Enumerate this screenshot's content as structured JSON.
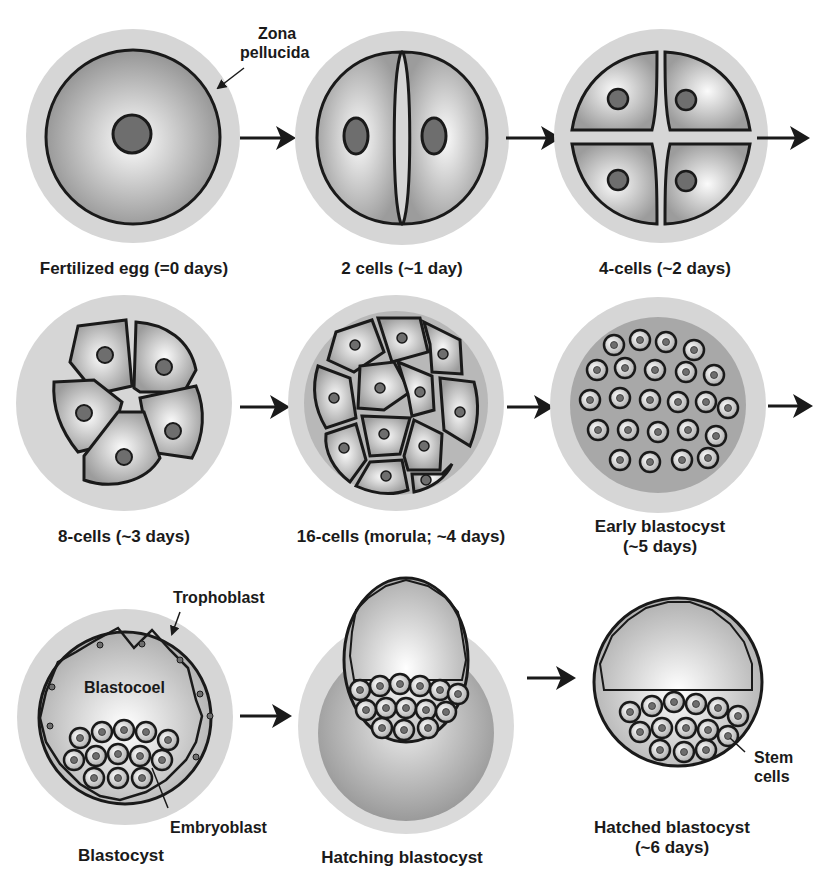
{
  "diagram": {
    "stages": [
      {
        "id": "fertilized-egg",
        "label": "Fertilized egg (=0 days)"
      },
      {
        "id": "2-cells",
        "label": "2 cells (~1 day)"
      },
      {
        "id": "4-cells",
        "label": "4-cells (~2 days)"
      },
      {
        "id": "8-cells",
        "label": "8-cells (~3 days)"
      },
      {
        "id": "16-cells",
        "label": "16-cells (morula; ~4 days)"
      },
      {
        "id": "early-blastocyst",
        "label_line1": "Early blastocyst",
        "label_line2": "(~5 days)"
      },
      {
        "id": "blastocyst",
        "label": "Blastocyst"
      },
      {
        "id": "hatching-blastocyst",
        "label": "Hatching blastocyst"
      },
      {
        "id": "hatched-blastocyst",
        "label_line1": "Hatched blastocyst",
        "label_line2": "(~6 days)"
      }
    ],
    "annotations": {
      "zona_line1": "Zona",
      "zona_line2": "pellucida",
      "trophoblast": "Trophoblast",
      "blastocoel": "Blastocoel",
      "embryoblast": "Embryoblast",
      "stem_line1": "Stem",
      "stem_line2": "cells"
    },
    "colors": {
      "zona": "#d9d9d9",
      "outline": "#1a1a1a",
      "nucleus": "#6e6e6e",
      "cell_light": "#f4f4f4",
      "cell_dark": "#9a9a9a"
    }
  }
}
